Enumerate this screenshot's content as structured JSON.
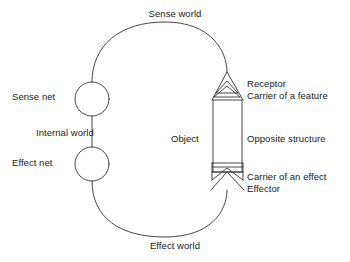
{
  "diagram": {
    "stroke_color": "#333333",
    "text_color": "#1a1a1a",
    "background": "#ffffff",
    "labels": {
      "sense_world": "Sense world",
      "effect_world": "Effect world",
      "sense_net": "Sense net",
      "effect_net": "Effect net",
      "internal_world": "Internal world",
      "object": "Object",
      "receptor": "Receptor",
      "carrier_of_a_feature": "Carrier of a feature",
      "opposite_structure": "Opposite structure",
      "carrier_of_an_effect": "Carrier of an effect",
      "effector": "Effector"
    },
    "nodes": [
      {
        "name": "sense-net-circle",
        "shape": "circle",
        "cx": 92,
        "cy": 99,
        "r": 17
      },
      {
        "name": "effect-net-circle",
        "shape": "circle",
        "cx": 92,
        "cy": 164,
        "r": 17
      },
      {
        "name": "object-body",
        "shape": "rect",
        "x": 213,
        "y": 100,
        "width": 29,
        "height": 72
      }
    ],
    "connectors": [
      {
        "name": "internal-world-link",
        "from": "sense-net-circle",
        "to": "effect-net-circle"
      },
      {
        "name": "sense-world-arc",
        "from": "sense-net-circle",
        "to": "receptor"
      },
      {
        "name": "effect-world-arc",
        "from": "effect-net-circle",
        "to": "effector"
      }
    ]
  }
}
